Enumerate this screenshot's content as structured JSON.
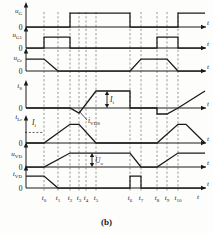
{
  "figure": {
    "caption": "(b)",
    "axis_zero_label": "0",
    "time_axis_label": "t",
    "signal_labels": [
      {
        "id": "uG",
        "base": "u",
        "sub": "G"
      },
      {
        "id": "uG1",
        "base": "u",
        "sub": "G1"
      },
      {
        "id": "uCr",
        "base": "u",
        "sub": "Cr"
      },
      {
        "id": "iS",
        "base": "i",
        "sub": "S"
      },
      {
        "id": "iLr",
        "base": "i",
        "sub": "Lr"
      },
      {
        "id": "uVD",
        "base": "u",
        "sub": "VD"
      },
      {
        "id": "iVD",
        "base": "i",
        "sub": "VD"
      }
    ],
    "annotations": [
      {
        "id": "Ii-is",
        "base": "I",
        "sub": "i",
        "kind": "double-arrow"
      },
      {
        "id": "Ii-ilr",
        "base": "I",
        "sub": "i",
        "kind": "level-line"
      },
      {
        "id": "iVDS",
        "base": "i",
        "sub": "VDS",
        "kind": "leader-line"
      },
      {
        "id": "Uo",
        "base": "U",
        "sub": "o",
        "kind": "double-arrow"
      }
    ],
    "time_marks": [
      {
        "label": "t",
        "sub": "0",
        "x": 44
      },
      {
        "label": "t",
        "sub": "1",
        "x": 58
      },
      {
        "label": "t",
        "sub": "2",
        "x": 70
      },
      {
        "label": "t",
        "sub": "3",
        "x": 79
      },
      {
        "label": "t",
        "sub": "4",
        "x": 86
      },
      {
        "label": "t",
        "sub": "5",
        "x": 96
      },
      {
        "label": "t",
        "sub": "6",
        "x": 130
      },
      {
        "label": "t",
        "sub": "7",
        "x": 141
      },
      {
        "label": "t",
        "sub": "8",
        "x": 157
      },
      {
        "label": "t",
        "sub": "9",
        "x": 167
      },
      {
        "label": "t",
        "sub": "10",
        "x": 178
      }
    ],
    "colors": {
      "ink": "#1a1a1a",
      "paper": "#fdfdfc",
      "dash": "#444444"
    }
  },
  "chart_data": {
    "type": "line",
    "title": "",
    "subtitle": "(b)",
    "xlabel": "t",
    "ylabel": "",
    "grid": "vertical-dashed-at-time-marks",
    "legend": "none",
    "x_tick_labels": [
      "t0",
      "t1",
      "t2",
      "t3",
      "t4",
      "t5",
      "t6",
      "t7",
      "t8",
      "t9",
      "t10"
    ],
    "x_tick_positions": [
      44,
      58,
      70,
      79,
      86,
      96,
      130,
      141,
      157,
      167,
      178
    ],
    "series": [
      {
        "name": "uG",
        "ylabel": "u_G",
        "type": "square-pulse",
        "points": [
          [
            26,
            0
          ],
          [
            70,
            0
          ],
          [
            70,
            1
          ],
          [
            130,
            1
          ],
          [
            130,
            0
          ],
          [
            178,
            0
          ],
          [
            178,
            1
          ],
          [
            205,
            1
          ]
        ]
      },
      {
        "name": "uG1",
        "ylabel": "u_G1",
        "type": "square-pulse",
        "points": [
          [
            26,
            0
          ],
          [
            44,
            0
          ],
          [
            44,
            1
          ],
          [
            70,
            1
          ],
          [
            70,
            0
          ],
          [
            157,
            0
          ],
          [
            157,
            1
          ],
          [
            178,
            1
          ],
          [
            178,
            0
          ],
          [
            205,
            0
          ]
        ]
      },
      {
        "name": "uCr",
        "ylabel": "u_Cr",
        "type": "trapezoid",
        "points": [
          [
            26,
            1
          ],
          [
            44,
            1
          ],
          [
            58,
            0
          ],
          [
            130,
            0
          ],
          [
            141,
            1
          ],
          [
            167,
            1
          ],
          [
            178,
            0
          ],
          [
            205,
            0
          ]
        ]
      },
      {
        "name": "iS",
        "ylabel": "i_S",
        "type": "piecewise",
        "points": [
          [
            26,
            0
          ],
          [
            70,
            0
          ],
          [
            79,
            -0.3
          ],
          [
            96,
            1
          ],
          [
            130,
            1
          ],
          [
            130,
            0
          ],
          [
            157,
            0
          ],
          [
            157,
            -0.35
          ],
          [
            167,
            -0.35
          ],
          [
            178,
            0
          ],
          [
            205,
            1
          ]
        ]
      },
      {
        "name": "iLr",
        "ylabel": "i_Lr",
        "type": "trapezoid",
        "points": [
          [
            26,
            0
          ],
          [
            44,
            0
          ],
          [
            70,
            1.1
          ],
          [
            79,
            1.1
          ],
          [
            96,
            0
          ],
          [
            157,
            0
          ],
          [
            178,
            1.1
          ],
          [
            186,
            1.1
          ],
          [
            205,
            0
          ]
        ]
      },
      {
        "name": "uVD",
        "ylabel": "u_VD",
        "type": "trapezoid",
        "points": [
          [
            26,
            0
          ],
          [
            44,
            0
          ],
          [
            70,
            1
          ],
          [
            130,
            1
          ],
          [
            141,
            0
          ],
          [
            157,
            0
          ],
          [
            178,
            1
          ],
          [
            205,
            1
          ]
        ]
      },
      {
        "name": "iVD",
        "ylabel": "i_VD",
        "type": "trapezoid",
        "points": [
          [
            26,
            1
          ],
          [
            44,
            1
          ],
          [
            58,
            0
          ],
          [
            130,
            0
          ],
          [
            130,
            1
          ],
          [
            141,
            1
          ],
          [
            141,
            0
          ],
          [
            157,
            0
          ],
          [
            205,
            0
          ]
        ]
      }
    ],
    "annotation_values": [
      {
        "text": "I_i",
        "meaning": "input current level on i_S"
      },
      {
        "text": "I_i",
        "meaning": "input current dashed level on i_Lr"
      },
      {
        "text": "i_VDS",
        "meaning": "body-diode current of switch"
      },
      {
        "text": "U_o",
        "meaning": "output voltage level on u_VD"
      }
    ]
  }
}
